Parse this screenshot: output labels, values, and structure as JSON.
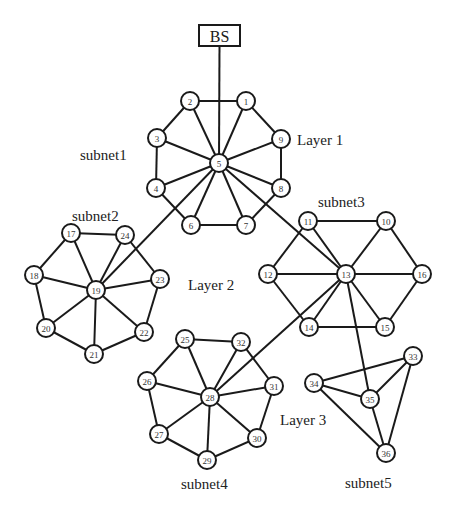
{
  "diagram": {
    "base_station": {
      "label": "BS",
      "x": 199,
      "y": 25,
      "w": 41,
      "h": 21,
      "connects_to": "5"
    },
    "captions": [
      {
        "id": "subnet1",
        "text": "subnet1",
        "x": 80,
        "y": 160
      },
      {
        "id": "subnet2",
        "text": "subnet2",
        "x": 72,
        "y": 221
      },
      {
        "id": "subnet3",
        "text": "subnet3",
        "x": 318,
        "y": 207
      },
      {
        "id": "subnet4",
        "text": "subnet4",
        "x": 181,
        "y": 489
      },
      {
        "id": "subnet5",
        "text": "subnet5",
        "x": 345,
        "y": 488
      },
      {
        "id": "layer1",
        "text": "Layer 1",
        "x": 297,
        "y": 145
      },
      {
        "id": "layer2",
        "text": "Layer 2",
        "x": 188,
        "y": 290
      },
      {
        "id": "layer3",
        "text": "Layer 3",
        "x": 280,
        "y": 425
      }
    ],
    "nodes": [
      {
        "id": "1",
        "x": 246,
        "y": 101
      },
      {
        "id": "2",
        "x": 190,
        "y": 101
      },
      {
        "id": "3",
        "x": 157,
        "y": 138
      },
      {
        "id": "4",
        "x": 156,
        "y": 188
      },
      {
        "id": "5",
        "x": 219,
        "y": 163
      },
      {
        "id": "6",
        "x": 191,
        "y": 225
      },
      {
        "id": "7",
        "x": 246,
        "y": 225
      },
      {
        "id": "8",
        "x": 281,
        "y": 188
      },
      {
        "id": "9",
        "x": 281,
        "y": 139
      },
      {
        "id": "10",
        "x": 386,
        "y": 221
      },
      {
        "id": "11",
        "x": 308,
        "y": 221
      },
      {
        "id": "12",
        "x": 268,
        "y": 274
      },
      {
        "id": "13",
        "x": 346,
        "y": 274
      },
      {
        "id": "14",
        "x": 309,
        "y": 327
      },
      {
        "id": "15",
        "x": 385,
        "y": 327
      },
      {
        "id": "16",
        "x": 422,
        "y": 274
      },
      {
        "id": "17",
        "x": 71,
        "y": 233
      },
      {
        "id": "18",
        "x": 34,
        "y": 275
      },
      {
        "id": "19",
        "x": 96,
        "y": 290
      },
      {
        "id": "20",
        "x": 46,
        "y": 328
      },
      {
        "id": "21",
        "x": 94,
        "y": 354
      },
      {
        "id": "22",
        "x": 144,
        "y": 332
      },
      {
        "id": "23",
        "x": 160,
        "y": 279
      },
      {
        "id": "24",
        "x": 125,
        "y": 235
      },
      {
        "id": "25",
        "x": 185,
        "y": 339
      },
      {
        "id": "26",
        "x": 147,
        "y": 381
      },
      {
        "id": "27",
        "x": 159,
        "y": 434
      },
      {
        "id": "28",
        "x": 210,
        "y": 397
      },
      {
        "id": "29",
        "x": 207,
        "y": 460
      },
      {
        "id": "30",
        "x": 257,
        "y": 438
      },
      {
        "id": "31",
        "x": 274,
        "y": 386
      },
      {
        "id": "32",
        "x": 241,
        "y": 342
      },
      {
        "id": "33",
        "x": 413,
        "y": 356
      },
      {
        "id": "34",
        "x": 314,
        "y": 383
      },
      {
        "id": "35",
        "x": 370,
        "y": 399
      },
      {
        "id": "36",
        "x": 386,
        "y": 453
      }
    ],
    "edges": [
      [
        "2",
        "1"
      ],
      [
        "1",
        "9"
      ],
      [
        "9",
        "8"
      ],
      [
        "8",
        "7"
      ],
      [
        "7",
        "6"
      ],
      [
        "6",
        "4"
      ],
      [
        "4",
        "3"
      ],
      [
        "3",
        "2"
      ],
      [
        "5",
        "1"
      ],
      [
        "5",
        "2"
      ],
      [
        "5",
        "3"
      ],
      [
        "5",
        "4"
      ],
      [
        "5",
        "6"
      ],
      [
        "5",
        "7"
      ],
      [
        "5",
        "8"
      ],
      [
        "5",
        "9"
      ],
      [
        "17",
        "24"
      ],
      [
        "24",
        "23"
      ],
      [
        "23",
        "22"
      ],
      [
        "22",
        "21"
      ],
      [
        "21",
        "20"
      ],
      [
        "20",
        "18"
      ],
      [
        "18",
        "17"
      ],
      [
        "19",
        "17"
      ],
      [
        "19",
        "18"
      ],
      [
        "19",
        "20"
      ],
      [
        "19",
        "21"
      ],
      [
        "19",
        "22"
      ],
      [
        "19",
        "23"
      ],
      [
        "19",
        "24"
      ],
      [
        "19",
        "5"
      ],
      [
        "11",
        "10"
      ],
      [
        "10",
        "16"
      ],
      [
        "16",
        "15"
      ],
      [
        "15",
        "14"
      ],
      [
        "14",
        "12"
      ],
      [
        "12",
        "11"
      ],
      [
        "13",
        "11"
      ],
      [
        "13",
        "10"
      ],
      [
        "13",
        "16"
      ],
      [
        "13",
        "15"
      ],
      [
        "13",
        "14"
      ],
      [
        "13",
        "12"
      ],
      [
        "13",
        "5"
      ],
      [
        "25",
        "32"
      ],
      [
        "32",
        "31"
      ],
      [
        "31",
        "30"
      ],
      [
        "30",
        "29"
      ],
      [
        "29",
        "27"
      ],
      [
        "27",
        "26"
      ],
      [
        "26",
        "25"
      ],
      [
        "28",
        "25"
      ],
      [
        "28",
        "32"
      ],
      [
        "28",
        "31"
      ],
      [
        "28",
        "30"
      ],
      [
        "28",
        "29"
      ],
      [
        "28",
        "27"
      ],
      [
        "28",
        "26"
      ],
      [
        "28",
        "13"
      ],
      [
        "33",
        "34"
      ],
      [
        "34",
        "35"
      ],
      [
        "35",
        "33"
      ],
      [
        "33",
        "36"
      ],
      [
        "34",
        "36"
      ],
      [
        "35",
        "36"
      ],
      [
        "35",
        "13"
      ]
    ],
    "node_radius": 9,
    "colors": {
      "stroke": "#1a1a1a",
      "node_fill": "#ffffff",
      "label": "#333333",
      "background": "#ffffff"
    }
  }
}
